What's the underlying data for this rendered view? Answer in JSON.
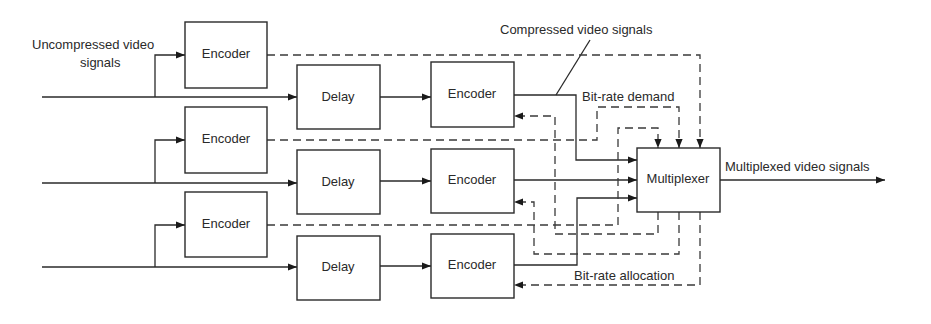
{
  "diagram": {
    "labels": {
      "uncompressed_line1": "Uncompressed video",
      "uncompressed_line2": "signals",
      "compressed": "Compressed video signals",
      "bitrate_demand": "Bit-rate demand",
      "bitrate_allocation": "Bit-rate allocation",
      "multiplexed": "Multiplexed video signals"
    },
    "blocks": {
      "pre_encoders": [
        "Encoder",
        "Encoder",
        "Encoder"
      ],
      "delays": [
        "Delay",
        "Delay",
        "Delay"
      ],
      "encoders": [
        "Encoder",
        "Encoder",
        "Encoder"
      ],
      "multiplexer": "Multiplexer"
    }
  }
}
